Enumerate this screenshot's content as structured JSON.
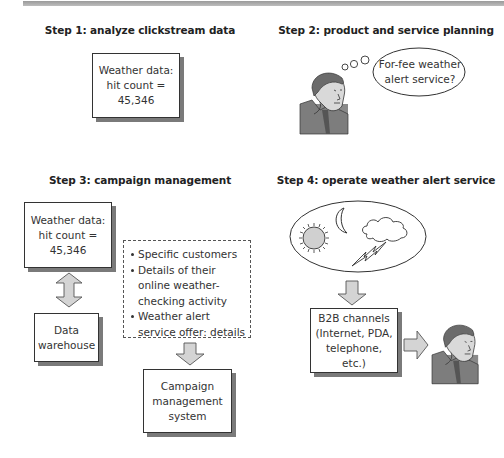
{
  "steps": [
    {
      "title": "Step 1: analyze clickstream data",
      "box_text": "Weather data: hit count = 45,346"
    },
    {
      "title": "Step 2: product and service planning",
      "thought_text": "For-fee weather alert service?"
    },
    {
      "title": "Step 3: campaign management",
      "box_text": "Weather data: hit count = 45,346",
      "warehouse_text": "Data warehouse",
      "details": [
        "Specific customers",
        "Details of their online weather-checking activity",
        "Weather alert service offer: details"
      ],
      "campaign_text": "Campaign management system"
    },
    {
      "title": "Step 4: operate weather alert service",
      "weather_icons": [
        "sun-icon",
        "moon-icon",
        "cloud-icon",
        "lightning-icon"
      ],
      "channels_text": "B2B channels (Internet, PDA, telephone, etc.)"
    }
  ],
  "colors": {
    "arrow_fill": "#d4d4d4",
    "arrow_stroke": "#555555",
    "shadow": "#7a7a7a",
    "topbar": "#a8a8a8"
  }
}
